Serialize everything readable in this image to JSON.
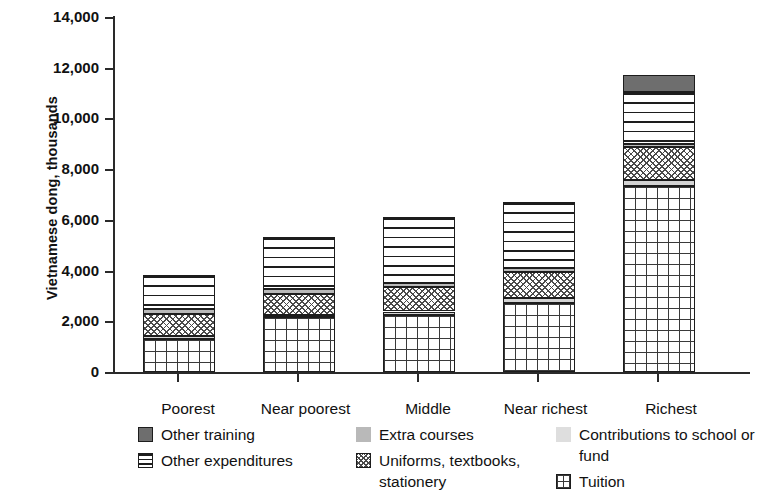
{
  "chart_data": {
    "type": "bar",
    "subtype": "stacked-bar",
    "title": "",
    "xlabel": "",
    "ylabel": "Vietnamese dong, thousands",
    "ylim": [
      0,
      14000
    ],
    "ytick_labels": [
      "14,000",
      "12,000",
      "10,000",
      "8,000",
      "6,000",
      "4,000",
      "2,000",
      "0"
    ],
    "ytick_values": [
      14000,
      12000,
      10000,
      8000,
      6000,
      4000,
      2000,
      0
    ],
    "grid": false,
    "legend_position": "bottom",
    "categories": [
      "Poorest",
      "Near poorest",
      "Middle",
      "Near richest",
      "Richest"
    ],
    "stack_order_bottom_to_top": [
      "Tuition",
      "Contributions to school or fund",
      "Uniforms, textbooks, stationery",
      "Extra courses",
      "Other expenditures",
      "Other training"
    ],
    "series": [
      {
        "name": "Tuition",
        "values": [
          1300,
          2150,
          2250,
          2720,
          7300
        ]
      },
      {
        "name": "Contributions to school or fund",
        "values": [
          120,
          100,
          130,
          200,
          250
        ]
      },
      {
        "name": "Uniforms, textbooks, stationery",
        "values": [
          870,
          800,
          950,
          1000,
          1300
        ]
      },
      {
        "name": "Extra courses",
        "values": [
          200,
          200,
          180,
          180,
          130
        ]
      },
      {
        "name": "Other expenditures",
        "values": [
          1310,
          2050,
          2590,
          2600,
          2020
        ]
      },
      {
        "name": "Other training",
        "values": [
          0,
          0,
          0,
          0,
          700
        ]
      }
    ],
    "totals": [
      3800,
      5300,
      6100,
      6700,
      11700
    ]
  },
  "axis": {
    "y_title": "Vietnamese dong, thousands",
    "ticks": [
      {
        "label": "14,000",
        "value": 14000
      },
      {
        "label": "12,000",
        "value": 12000
      },
      {
        "label": "10,000",
        "value": 10000
      },
      {
        "label": "8,000",
        "value": 8000
      },
      {
        "label": "6,000",
        "value": 6000
      },
      {
        "label": "4,000",
        "value": 4000
      },
      {
        "label": "2,000",
        "value": 2000
      },
      {
        "label": "0",
        "value": 0
      }
    ]
  },
  "categories": [
    {
      "label": "Poorest"
    },
    {
      "label": "Near poorest"
    },
    {
      "label": "Middle"
    },
    {
      "label": "Near richest"
    },
    {
      "label": "Richest"
    }
  ],
  "legend": {
    "columns": [
      {
        "items": [
          {
            "label": "Other training",
            "swatch": "solid-dark-gray-square-icon",
            "color": "#6e6e6e"
          },
          {
            "label": "Other expenditures",
            "swatch": "horizontal-lines-square-icon",
            "color": "#ffffff"
          }
        ]
      },
      {
        "items": [
          {
            "label": "Extra courses",
            "swatch": "solid-medium-gray-square-icon",
            "color": "#b9b9b9"
          },
          {
            "label": "Uniforms, textbooks, stationery",
            "swatch": "checkered-square-icon",
            "color": "#ffffff"
          }
        ]
      },
      {
        "items": [
          {
            "label": "Contributions to school or fund",
            "swatch": "solid-light-gray-square-icon",
            "color": "#dedede"
          },
          {
            "label": "Tuition",
            "swatch": "grid-square-icon",
            "color": "#ffffff"
          }
        ]
      }
    ]
  }
}
